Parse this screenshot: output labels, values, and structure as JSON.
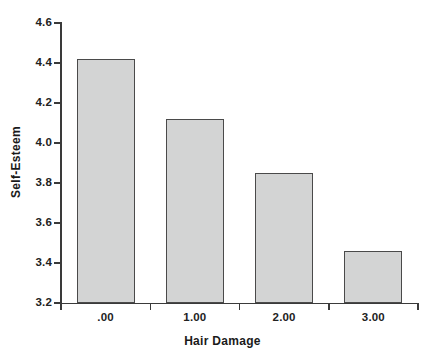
{
  "chart_data": {
    "type": "bar",
    "title": "",
    "subtitle": "",
    "xlabel": "Hair Damage",
    "ylabel": "Self-Esteem",
    "categories": [
      ".00",
      "1.00",
      "2.00",
      "3.00"
    ],
    "values": [
      4.42,
      4.12,
      3.85,
      3.46
    ],
    "series": [
      {
        "name": "Self-Esteem",
        "values": [
          4.42,
          4.12,
          3.85,
          3.46
        ]
      }
    ],
    "ylim": [
      3.2,
      4.6
    ],
    "ytick_labels": [
      "4.6",
      "4.4",
      "4.2",
      "4.0",
      "3.8",
      "3.6",
      "3.4",
      "3.2"
    ],
    "ytick_values": [
      4.6,
      4.4,
      4.2,
      4.0,
      3.8,
      3.6,
      3.4,
      3.2
    ],
    "xtick_labels": [
      ".00",
      "1.00",
      "2.00",
      "3.00"
    ],
    "grid": false,
    "legend": false,
    "legend_position": "none",
    "annotations": [],
    "colors": {
      "bar_fill": "#d3d4d4",
      "bar_border": "#4a4a4a",
      "axis": "#3a3a3a",
      "text": "#1a1a1a",
      "background": "#ffffff"
    }
  },
  "axes": {
    "y_title": "Self-Esteem",
    "x_title": "Hair Damage",
    "y_ticks": [
      {
        "label": "4.6",
        "value": 4.6
      },
      {
        "label": "4.4",
        "value": 4.4
      },
      {
        "label": "4.2",
        "value": 4.2
      },
      {
        "label": "4.0",
        "value": 4.0
      },
      {
        "label": "3.8",
        "value": 3.8
      },
      {
        "label": "3.6",
        "value": 3.6
      },
      {
        "label": "3.4",
        "value": 3.4
      },
      {
        "label": "3.2",
        "value": 3.2
      }
    ],
    "x_ticks": [
      {
        "label": ".00",
        "value": 0
      },
      {
        "label": "1.00",
        "value": 1
      },
      {
        "label": "2.00",
        "value": 2
      },
      {
        "label": "3.00",
        "value": 3
      }
    ]
  }
}
